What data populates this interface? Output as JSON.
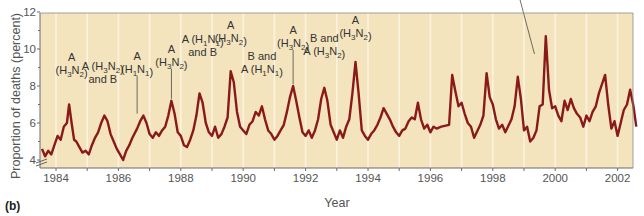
{
  "panel_label": "(b)",
  "colors": {
    "plot_background": "#f3e4bd",
    "gridline": "#fbf3df",
    "series_line": "#8a1a1a",
    "axis": "#6b6b6b",
    "text": "#555555"
  },
  "chart_data": {
    "type": "line",
    "title": "",
    "xlabel": "Year",
    "ylabel": "Proportion of deaths (percent)",
    "xlim": [
      1983.5,
      2002.8
    ],
    "ylim": [
      3.5,
      12
    ],
    "y_axis_break": true,
    "grid": "vertical lines at each year",
    "x_ticks": [
      1984,
      1986,
      1988,
      1990,
      1992,
      1994,
      1996,
      1998,
      2000,
      2002
    ],
    "y_ticks": [
      4,
      6,
      8,
      10,
      12
    ],
    "series": [
      {
        "name": "Proportion of deaths",
        "x": [
          1983.55,
          1983.65,
          1983.75,
          1983.85,
          1983.95,
          1984.05,
          1984.15,
          1984.25,
          1984.35,
          1984.42,
          1984.5,
          1984.58,
          1984.65,
          1984.75,
          1984.85,
          1984.95,
          1985.05,
          1985.15,
          1985.25,
          1985.35,
          1985.45,
          1985.55,
          1985.65,
          1985.75,
          1985.85,
          1985.95,
          1986.05,
          1986.15,
          1986.25,
          1986.35,
          1986.45,
          1986.6,
          1986.7,
          1986.8,
          1986.9,
          1987.0,
          1987.1,
          1987.2,
          1987.3,
          1987.4,
          1987.5,
          1987.6,
          1987.7,
          1987.8,
          1987.9,
          1988.0,
          1988.1,
          1988.2,
          1988.3,
          1988.4,
          1988.5,
          1988.6,
          1988.7,
          1988.8,
          1988.9,
          1989.0,
          1989.1,
          1989.2,
          1989.3,
          1989.4,
          1989.5,
          1989.6,
          1989.7,
          1989.8,
          1989.9,
          1990.0,
          1990.1,
          1990.2,
          1990.3,
          1990.4,
          1990.5,
          1990.6,
          1990.7,
          1990.8,
          1990.9,
          1991.0,
          1991.1,
          1991.2,
          1991.3,
          1991.4,
          1991.5,
          1991.6,
          1991.7,
          1991.8,
          1991.9,
          1992.0,
          1992.1,
          1992.2,
          1992.3,
          1992.4,
          1992.5,
          1992.6,
          1992.7,
          1992.8,
          1992.9,
          1993.0,
          1993.1,
          1993.2,
          1993.3,
          1993.4,
          1993.5,
          1993.6,
          1993.7,
          1993.8,
          1993.9,
          1994.0,
          1994.1,
          1994.2,
          1994.3,
          1994.4,
          1994.5,
          1994.7,
          1994.8,
          1994.9,
          1995.0,
          1995.1,
          1995.2,
          1995.3,
          1995.4,
          1995.5,
          1995.6,
          1995.7,
          1995.8,
          1995.9,
          1996.0,
          1996.1,
          1996.2,
          1996.35,
          1996.6,
          1996.7,
          1996.8,
          1996.9,
          1997.0,
          1997.1,
          1997.2,
          1997.3,
          1997.4,
          1997.6,
          1997.7,
          1997.8,
          1997.9,
          1998.0,
          1998.1,
          1998.2,
          1998.3,
          1998.4,
          1998.6,
          1998.7,
          1998.8,
          1998.9,
          1999.0,
          1999.1,
          1999.2,
          1999.3,
          1999.4,
          1999.5,
          1999.6,
          1999.7,
          1999.8,
          1999.9,
          2000.0,
          2000.1,
          2000.2,
          2000.3,
          2000.4,
          2000.5,
          2000.6,
          2000.7,
          2000.8,
          2000.9,
          2001.0,
          2001.1,
          2001.2,
          2001.3,
          2001.4,
          2001.6,
          2001.7,
          2001.8,
          2001.9,
          2002.0,
          2002.1,
          2002.2,
          2002.3,
          2002.4,
          2002.5,
          2002.6
        ],
        "y": [
          4.6,
          4.2,
          4.5,
          4.3,
          4.8,
          5.3,
          5.1,
          5.8,
          6.0,
          7.0,
          6.0,
          5.1,
          5.0,
          4.7,
          4.4,
          4.5,
          4.3,
          4.8,
          5.2,
          5.5,
          6.0,
          6.4,
          6.1,
          5.4,
          5.0,
          4.6,
          4.3,
          4.0,
          4.5,
          4.8,
          5.2,
          5.7,
          6.1,
          6.4,
          6.0,
          5.4,
          5.2,
          5.5,
          5.3,
          5.6,
          5.8,
          6.4,
          7.2,
          6.5,
          5.5,
          5.3,
          4.8,
          4.7,
          5.1,
          5.6,
          6.4,
          7.6,
          7.1,
          6.0,
          5.5,
          5.3,
          5.8,
          5.2,
          5.4,
          5.8,
          6.3,
          8.8,
          8.2,
          6.6,
          5.8,
          5.6,
          5.4,
          5.9,
          6.1,
          6.6,
          6.4,
          6.9,
          6.2,
          5.6,
          5.4,
          5.1,
          5.3,
          5.6,
          5.9,
          6.6,
          7.4,
          8.0,
          7.2,
          6.3,
          5.5,
          5.3,
          5.6,
          5.2,
          5.6,
          6.2,
          7.3,
          7.9,
          7.2,
          5.9,
          5.5,
          5.1,
          5.6,
          5.2,
          5.8,
          6.2,
          7.6,
          9.3,
          7.6,
          5.6,
          5.3,
          5.1,
          5.4,
          5.6,
          5.9,
          6.3,
          6.8,
          6.2,
          5.8,
          5.5,
          5.3,
          5.6,
          5.7,
          6.1,
          6.3,
          6.2,
          7.1,
          6.2,
          5.7,
          5.9,
          5.5,
          5.8,
          5.7,
          5.8,
          5.9,
          8.6,
          7.7,
          6.9,
          7.1,
          6.5,
          6.0,
          5.8,
          5.2,
          5.9,
          6.4,
          8.7,
          7.4,
          7.0,
          6.2,
          5.7,
          5.9,
          5.5,
          6.2,
          6.9,
          8.5,
          7.3,
          5.6,
          5.8,
          5.0,
          5.2,
          5.6,
          6.9,
          7.0,
          10.7,
          7.8,
          6.8,
          6.9,
          6.4,
          6.1,
          7.2,
          6.7,
          7.3,
          6.8,
          6.5,
          6.3,
          5.8,
          6.4,
          6.1,
          6.6,
          6.9,
          7.6,
          8.6,
          7.0,
          5.7,
          6.1,
          5.3,
          6.0,
          6.7,
          7.0,
          7.8,
          7.0,
          5.8
        ]
      }
    ],
    "annotations": [
      {
        "text": [
          "A",
          "(H3N2)"
        ],
        "x": 1984.5,
        "peak": 7.0
      },
      {
        "text": [
          "A (H3N2)",
          "and B"
        ],
        "x": 1985.5,
        "peak": 6.4
      },
      {
        "text": [
          "A",
          "(H1N1)"
        ],
        "x": 1986.6,
        "peak": 6.4
      },
      {
        "text": [
          "A",
          "(H3N2)"
        ],
        "x": 1987.7,
        "peak": 7.2
      },
      {
        "text": [
          "A (H1N1)",
          "and B"
        ],
        "x": 1988.7,
        "peak": 7.6
      },
      {
        "text": [
          "A",
          "(H3N2)"
        ],
        "x": 1989.6,
        "peak": 8.8
      },
      {
        "text": [
          "B and",
          "A (H1N1)"
        ],
        "x": 1990.6,
        "peak": 6.9
      },
      {
        "text": [
          "A",
          "(H3N2)"
        ],
        "x": 1991.6,
        "peak": 8.0
      },
      {
        "text": [
          "B and",
          "A (H3N2)"
        ],
        "x": 1992.6,
        "peak": 7.9
      },
      {
        "text": [
          "A",
          "(H3N2)"
        ],
        "x": 1993.6,
        "peak": 9.3
      },
      {
        "text": [
          "A",
          "(H3N2)"
        ],
        "x": 1999.4,
        "peak": 10.7
      }
    ]
  }
}
